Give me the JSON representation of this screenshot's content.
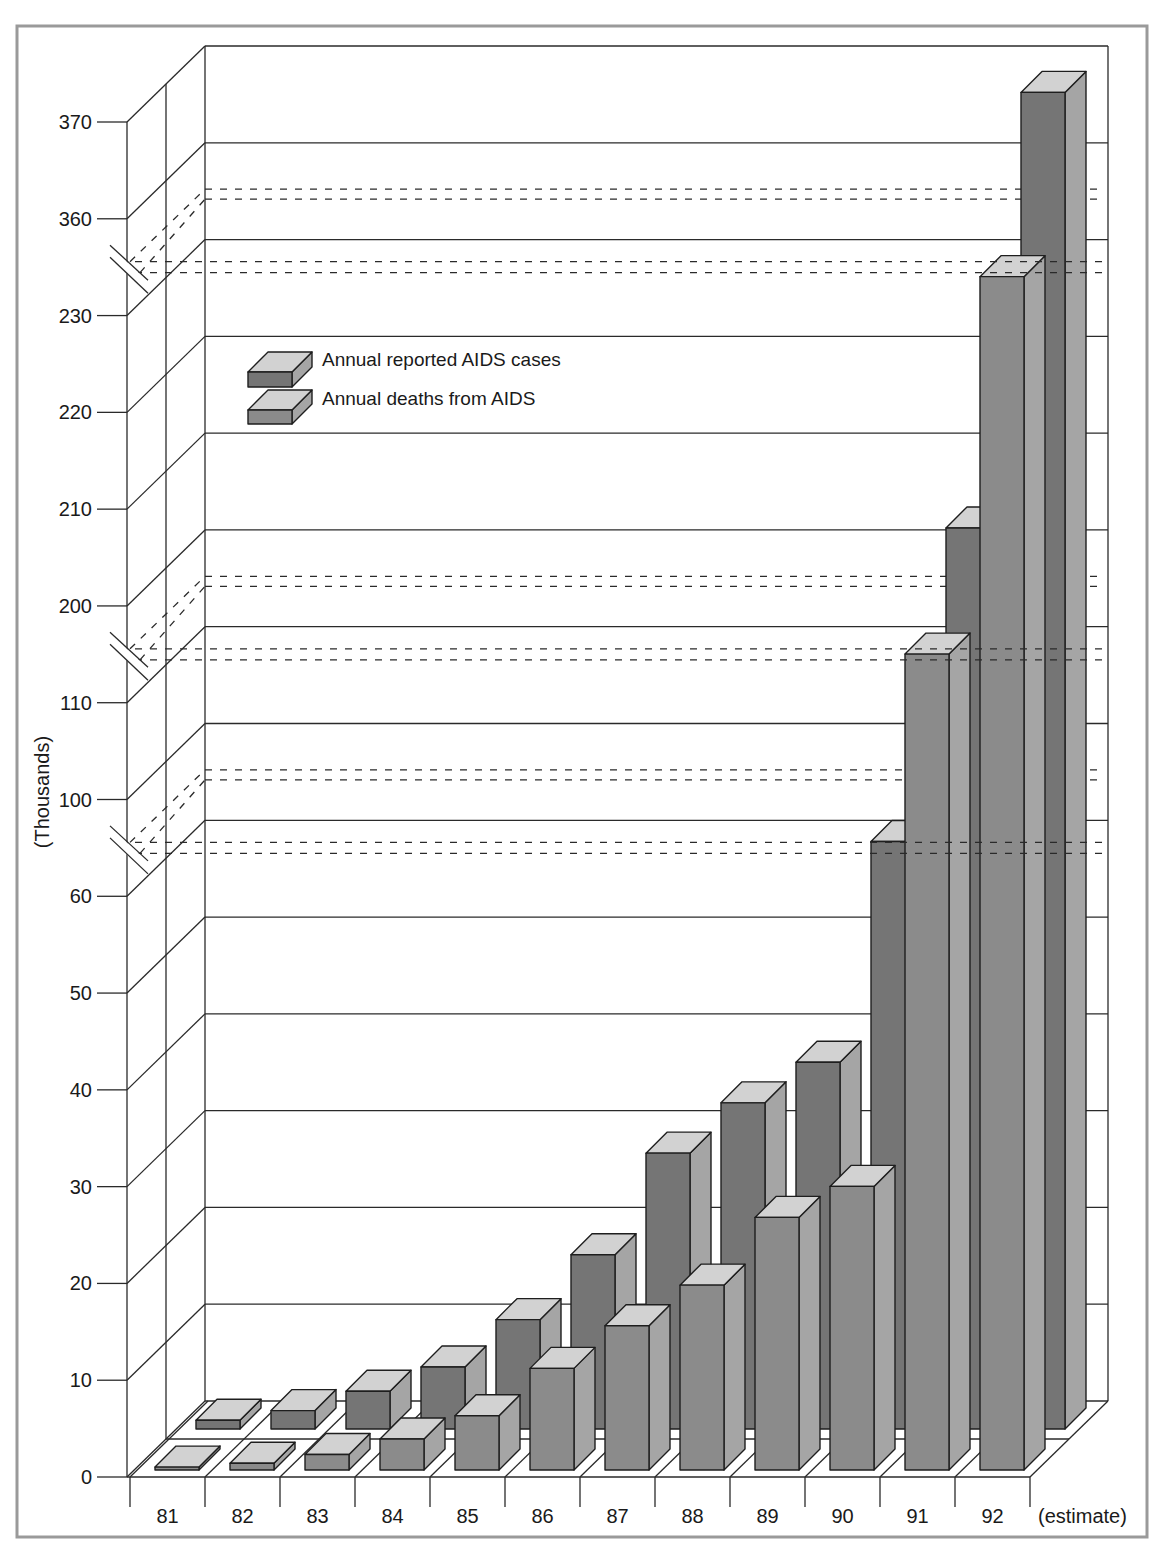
{
  "chart_data": {
    "type": "bar",
    "subtype": "3d-grouped-bar",
    "title": "",
    "xlabel": "",
    "ylabel": "(Thousands)",
    "categories": [
      "81",
      "82",
      "83",
      "84",
      "85",
      "86",
      "87",
      "88",
      "89",
      "90",
      "91",
      "92"
    ],
    "category_note": "(estimate)",
    "series": [
      {
        "name": "Annual reported AIDS cases",
        "values": [
          0.9,
          1.9,
          3.9,
          6.4,
          11.3,
          18.0,
          28.5,
          33.7,
          37.9,
          60.7,
          203.1,
          368.1
        ],
        "front_color": "#757575"
      },
      {
        "name": "Annual deaths from AIDS",
        "values": [
          0.3,
          0.7,
          1.6,
          3.2,
          5.6,
          10.5,
          14.9,
          19.1,
          26.1,
          29.3,
          114.3,
          233.3
        ],
        "front_color": "#8b8b8b"
      }
    ],
    "top_face_color": "#d2d2d2",
    "side_face_color": "#a5a5a5",
    "frame_color": "#9a9a9a",
    "yticks": [
      0,
      10,
      20,
      30,
      40,
      50,
      60,
      100,
      110,
      200,
      210,
      220,
      230,
      360,
      370
    ],
    "axis_breaks": [
      [
        60,
        100
      ],
      [
        110,
        200
      ],
      [
        230,
        360
      ]
    ],
    "ylim": [
      0,
      370
    ],
    "grid": true,
    "legend_position": "upper-left, inside plot"
  }
}
